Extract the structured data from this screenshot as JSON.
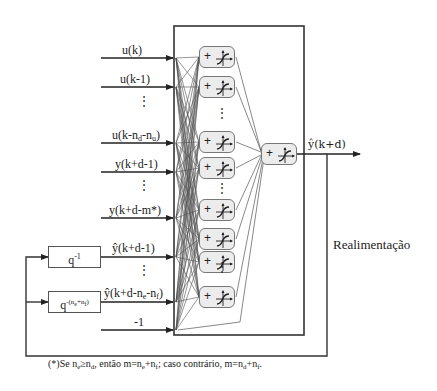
{
  "diagram": {
    "title": "",
    "inputs": [
      {
        "id": "u_k",
        "label": "u(k)",
        "y": 58
      },
      {
        "id": "u_k_1",
        "label": "u(k-1)",
        "y": 87
      },
      {
        "id": "u_k_nd_nu",
        "label": "u(k-n",
        "sub1": "d",
        "mid": "-n",
        "sub2": "u",
        "tail": ")",
        "y": 143
      },
      {
        "id": "y_k_d_1",
        "label": "y(k+d-1)",
        "y": 172
      },
      {
        "id": "y_k_d_m",
        "label": "y(k+d-m*)",
        "y": 218
      },
      {
        "id": "yhat_k_d_1",
        "label": "ŷ(k+d-1)",
        "y": 257
      },
      {
        "id": "yhat_k_d_ne_nf",
        "label": "ŷ(k+d-n",
        "sub1": "e",
        "mid": "-n",
        "sub2": "f",
        "tail": ")",
        "y": 302
      },
      {
        "id": "bias",
        "label": "-1",
        "y": 330
      }
    ],
    "ellipsis": "⋮",
    "delays": [
      {
        "id": "q1",
        "label": "q",
        "sup": "-1"
      },
      {
        "id": "qn",
        "label": "q",
        "sup": "-(n",
        "sup_sub1": "e",
        "sup_mid": "+n",
        "sup_sub2": "f",
        "sup_tail": ")"
      }
    ],
    "hidden_neurons": [
      57,
      87,
      142,
      168,
      210,
      239,
      297
    ],
    "neuron_symbol": "+",
    "output_label": "ŷ(k+d)",
    "feedback_label": "Realimentação",
    "footnote": {
      "prefix": "(*)Se n",
      "s1": "e",
      "t1": "≥n",
      "s2": "d",
      "t2": ", então m=n",
      "s3": "e",
      "t3": "+n",
      "s4": "f",
      "t4": "; caso contrário, m=n",
      "s5": "d",
      "t5": "+n",
      "s6": "f",
      "t6": "."
    }
  }
}
